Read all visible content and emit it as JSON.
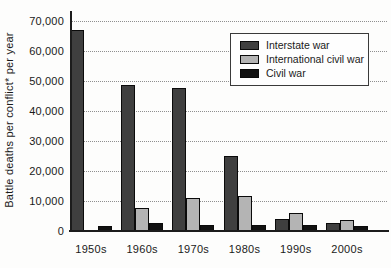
{
  "figure": {
    "background": "#fdfdfc",
    "axis_color": "#1c1c1c",
    "grid_color": "#8f8f8f"
  },
  "chart_data": {
    "type": "bar",
    "title": "",
    "xlabel": "",
    "ylabel": "Battle deaths per conflict* per year",
    "categories": [
      "1950s",
      "1960s",
      "1970s",
      "1980s",
      "1990s",
      "2000s"
    ],
    "series": [
      {
        "name": "Interstate war",
        "color": "#3f3f3f",
        "values": [
          67000,
          48500,
          47500,
          25000,
          4000,
          2500
        ]
      },
      {
        "name": "International civil war",
        "color": "#b4b4b4",
        "values": [
          0,
          7500,
          11000,
          11500,
          6000,
          3500
        ]
      },
      {
        "name": "Civil war",
        "color": "#111111",
        "values": [
          1500,
          2500,
          2000,
          2000,
          2000,
          1500
        ]
      }
    ],
    "ylim": [
      0,
      70000
    ],
    "ytick_interval": 10000,
    "ytick_labels": [
      "0",
      "10,000",
      "20,000",
      "30,000",
      "40,000",
      "50,000",
      "60,000",
      "70,000"
    ],
    "grid": "horizontal-dotted",
    "legend_position": "top-right"
  }
}
